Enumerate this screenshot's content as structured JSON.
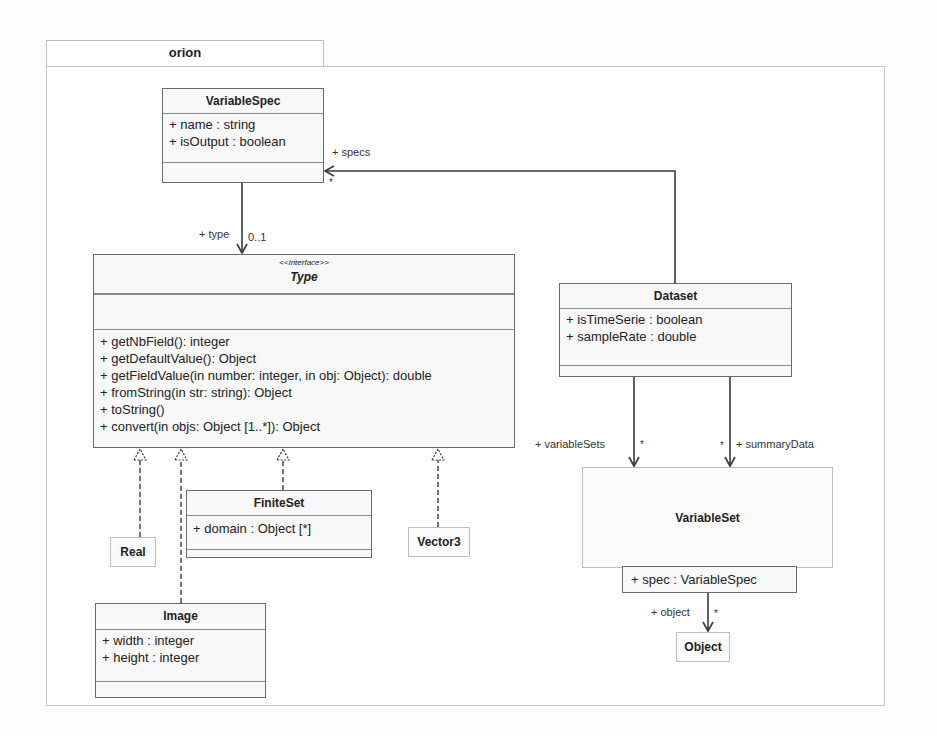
{
  "package": {
    "name": "orion"
  },
  "classes": {
    "variable_spec": {
      "name": "VariableSpec",
      "attributes": [
        "+ name : string",
        "+ isOutput : boolean"
      ]
    },
    "type": {
      "stereotype": "<<Interface>>",
      "name": "Type",
      "operations": [
        "+ getNbField(): integer",
        "+ getDefaultValue(): Object",
        "+ getFieldValue(in number: integer, in obj: Object): double",
        "+ fromString(in str: string): Object",
        "+ toString()",
        "+ convert(in objs: Object [1..*]): Object"
      ]
    },
    "dataset": {
      "name": "Dataset",
      "attributes": [
        "+ isTimeSerie : boolean",
        "+ sampleRate : double"
      ]
    },
    "variable_set": {
      "name": "VariableSet",
      "qualifier": "+ spec : VariableSpec"
    },
    "object": {
      "name": "Object"
    },
    "finite_set": {
      "name": "FiniteSet",
      "attributes": [
        "+ domain : Object [*]"
      ]
    },
    "real": {
      "name": "Real"
    },
    "vector3": {
      "name": "Vector3"
    },
    "image": {
      "name": "Image",
      "attributes": [
        "+ width : integer",
        "+ height : integer"
      ]
    }
  },
  "associations": {
    "type": {
      "role": "+ type",
      "multiplicity": "0..1"
    },
    "specs": {
      "role": "+ specs",
      "multiplicity": "*"
    },
    "variable_sets": {
      "role": "+ variableSets",
      "multiplicity": "*"
    },
    "summary_data": {
      "role": "+ summaryData",
      "multiplicity": "*"
    },
    "object": {
      "role": "+ object",
      "multiplicity": "*"
    }
  },
  "colors": {
    "line": "#4a4a4a",
    "border": "#6a6a6a",
    "fill": "#f8f8f8"
  }
}
